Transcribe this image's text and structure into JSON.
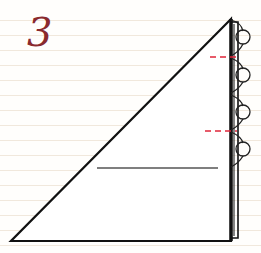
{
  "diagram": {
    "step_number": "3",
    "type": "folding-instruction",
    "colors": {
      "outline": "#111111",
      "step_number": "#8a2a2e",
      "fold_mark_red": "#e0263a",
      "crease_teal": "#2a8a98",
      "crease_gray": "#555555",
      "ruled_line": "#f1e8dc"
    },
    "elements": [
      {
        "name": "triangle-outline",
        "description": "right triangle with apex top-right"
      },
      {
        "name": "spine-layers",
        "description": "thick folded edge on right side"
      },
      {
        "name": "loop-arrows",
        "count": 4
      },
      {
        "name": "dashed-fold-marks",
        "count": 2,
        "color": "red"
      },
      {
        "name": "crease-line-upper",
        "color": "red-to-teal"
      },
      {
        "name": "crease-line-lower",
        "color": "gray"
      }
    ]
  }
}
